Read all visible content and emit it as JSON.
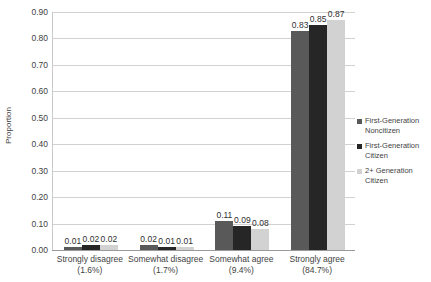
{
  "chart_data": {
    "type": "bar",
    "title": "",
    "xlabel": "",
    "ylabel": "Proportion",
    "ylim": [
      0.0,
      0.9
    ],
    "ytick_labels": [
      "0.90",
      "0.80",
      "0.70",
      "0.60",
      "0.50",
      "0.40",
      "0.30",
      "0.20",
      "0.10",
      "0.00"
    ],
    "ytick_values": [
      0.9,
      0.8,
      0.7,
      0.6,
      0.5,
      0.4,
      0.3,
      0.2,
      0.1,
      0.0
    ],
    "grid": true,
    "legend_position": "right",
    "categories": [
      "Strongly disagree",
      "Somewhat disagree",
      "Somewhat agree",
      "Strongly agree"
    ],
    "category_percents": [
      "(1.6%)",
      "(1.7%)",
      "(9.4%)",
      "(84.7%)"
    ],
    "series": [
      {
        "name": "First-Generation Noncitizen",
        "name_line1": "First-Generation",
        "name_line2": "Noncitizen",
        "color": "#595959",
        "values": [
          0.01,
          0.02,
          0.11,
          0.83
        ],
        "labels": [
          "0.01",
          "0.02",
          "0.11",
          "0.83"
        ]
      },
      {
        "name": "First-Generation Citizen",
        "name_line1": "First-Generation",
        "name_line2": "Citizen",
        "color": "#262626",
        "values": [
          0.02,
          0.01,
          0.09,
          0.85
        ],
        "labels": [
          "0.02",
          "0.01",
          "0.09",
          "0.85"
        ]
      },
      {
        "name": "2+ Generation Citizen",
        "name_line1": "2+ Generation",
        "name_line2": "Citizen",
        "color": "#d2d2d2",
        "values": [
          0.02,
          0.01,
          0.08,
          0.87
        ],
        "labels": [
          "0.02",
          "0.01",
          "0.08",
          "0.87"
        ]
      }
    ],
    "colors": {
      "gridline": "#d2d2d2",
      "axis": "#9a9a9a",
      "text": "#3f3f3f",
      "background": "#ffffff"
    }
  }
}
